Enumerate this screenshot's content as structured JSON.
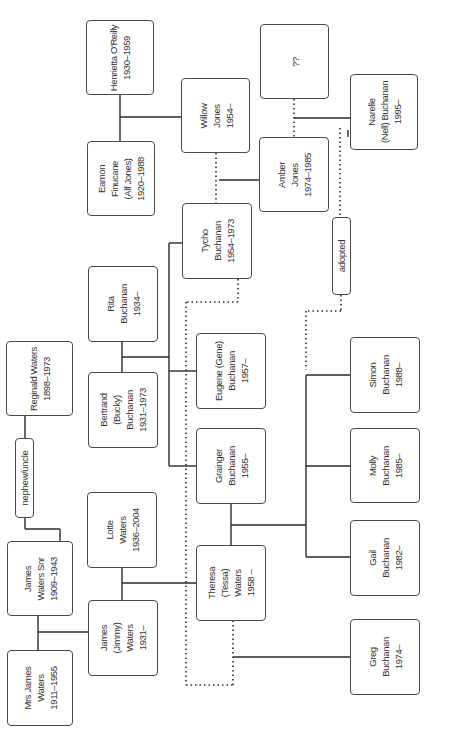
{
  "diagram": {
    "orientation": "rotated-90-ccw",
    "colors": {
      "line": "#2b2b2b",
      "box_border": "#4a4a4a",
      "text": "#333333",
      "background": "#ffffff"
    },
    "people": {
      "henrietta": {
        "label": "Henrietta O'Reilly\n1930–1959"
      },
      "eamon": {
        "label": "Eamon\nFinucane\n(Alf Jones)\n1920–1988"
      },
      "willow": {
        "label": "Willow\nJones\n1954–"
      },
      "unknown": {
        "label": "??"
      },
      "amber": {
        "label": "Amber\nJones\n1974–1985"
      },
      "narelle": {
        "label": "Narelle\n(Nell) Buchanan\n1995–"
      },
      "tycho": {
        "label": "Tycho\nBuchanan\n1954–1973"
      },
      "rita": {
        "label": "Rita\nBuchanan\n1934–"
      },
      "bertrand": {
        "label": "Bertrand\n(Bucky)\nBuchanan\n1931–1973"
      },
      "eugene": {
        "label": "Eugene (Gene)\nBuchanan\n1957–"
      },
      "grainger": {
        "label": "Grainger\nBuchanan\n1955–"
      },
      "lotte": {
        "label": "Lotte\nWaters\n1936–2004"
      },
      "theresa": {
        "label": "Theresa\n(Tessa)\nWaters\n1958 –"
      },
      "james_snr": {
        "label": "James\nWaters Snr\n1909–1943"
      },
      "jimmy": {
        "label": "James\n(Jimmy)\nWaters\n1931–"
      },
      "mrs_james": {
        "label": "Mrs James\nWaters\n1911–1955"
      },
      "reginald": {
        "label": "Reginald Waters\n1898–1973"
      },
      "simon": {
        "label": "Simon\nBuchanan\n1988–"
      },
      "molly": {
        "label": "Molly\nBuchanan\n1985–"
      },
      "gail": {
        "label": "Gail\nBuchanan\n1982–"
      },
      "greg": {
        "label": "Greg\nBuchanan\n1974–"
      }
    },
    "relations": {
      "nephew_uncle": {
        "label": "nephew/uncle"
      },
      "adopted": {
        "label": "adopted"
      }
    }
  }
}
